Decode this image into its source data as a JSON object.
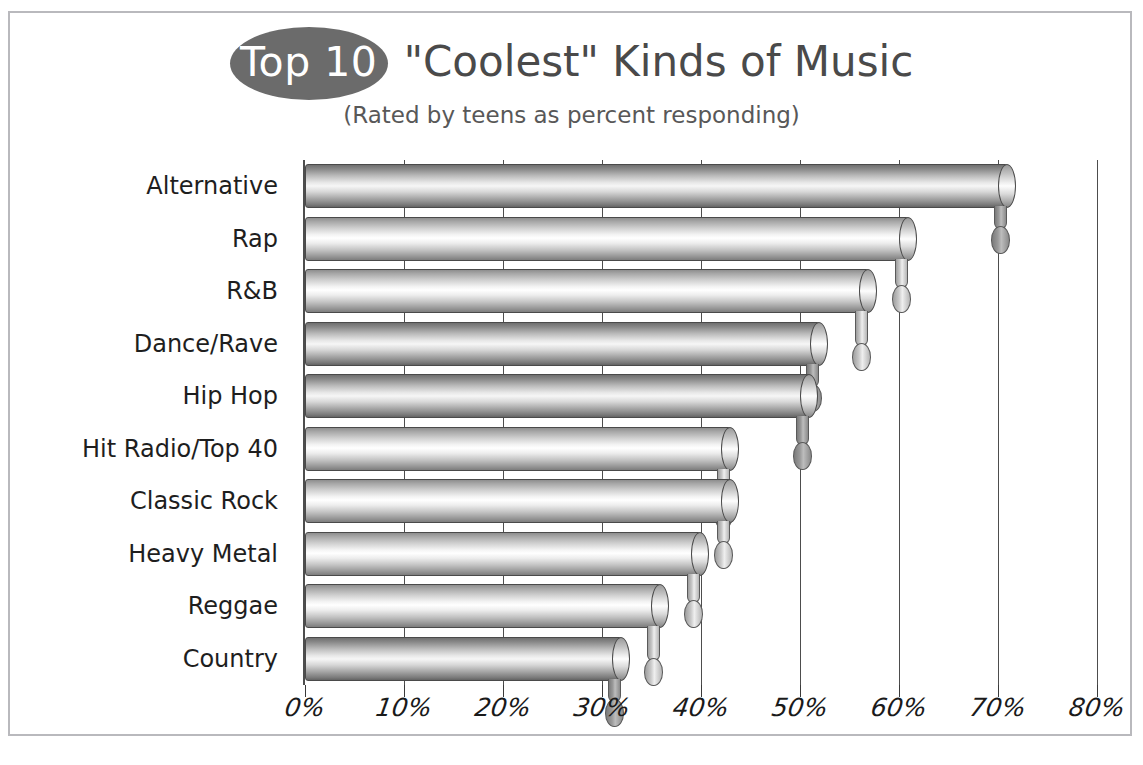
{
  "title": {
    "badge": "Top 10",
    "main": "\"Coolest\" Kinds of Music",
    "subtitle": "(Rated by teens as percent responding)"
  },
  "colors": {
    "badge_fill": "#6b6b6b",
    "title_text": "#4a4a4a",
    "frame_border": "#b9b9bd",
    "axis": "#4d4d4d",
    "background": "#ffffff"
  },
  "chart_data": {
    "type": "bar",
    "orientation": "horizontal",
    "title": "\"Coolest\" Kinds of Music",
    "subtitle": "(Rated by teens as percent responding)",
    "xlabel": "",
    "ylabel": "",
    "xlim": [
      0,
      80
    ],
    "xtick_labels": [
      "0%",
      "10%",
      "20%",
      "30%",
      "40%",
      "50%",
      "60%",
      "70%",
      "80%"
    ],
    "xticks": [
      0,
      10,
      20,
      30,
      40,
      50,
      60,
      70,
      80
    ],
    "grid": true,
    "legend": "none",
    "categories": [
      "Alternative",
      "Rap",
      "R&B",
      "Dance/Rave",
      "Hip Hop",
      "Hit Radio/Top 40",
      "Classic Rock",
      "Heavy Metal",
      "Reggae",
      "Country"
    ],
    "values": [
      71,
      61,
      57,
      52,
      51,
      43,
      43,
      40,
      36,
      32
    ],
    "units": "percent",
    "bars": [
      {
        "label": "Alternative",
        "value": 71,
        "shade": "dark"
      },
      {
        "label": "Rap",
        "value": 61,
        "shade": "light"
      },
      {
        "label": "R&B",
        "value": 57,
        "shade": "light"
      },
      {
        "label": "Dance/Rave",
        "value": 52,
        "shade": "dark"
      },
      {
        "label": "Hip Hop",
        "value": 51,
        "shade": "dark"
      },
      {
        "label": "Hit Radio/Top 40",
        "value": 43,
        "shade": "light"
      },
      {
        "label": "Classic Rock",
        "value": 43,
        "shade": "light"
      },
      {
        "label": "Heavy Metal",
        "value": 40,
        "shade": "light"
      },
      {
        "label": "Reggae",
        "value": 36,
        "shade": "light"
      },
      {
        "label": "Country",
        "value": 32,
        "shade": "dark"
      }
    ]
  }
}
